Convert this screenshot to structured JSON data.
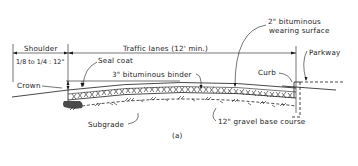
{
  "figure": {
    "label": "(a)",
    "type": "cross-section diagram of road pavement"
  },
  "dimensions": {
    "shoulder": {
      "label": "Shoulder",
      "slope": "1/8 to 1/4 : 12\""
    },
    "traffic_lanes": {
      "label": "Traffic lanes (12' min.)"
    }
  },
  "callouts": {
    "seal_coat": "Seal coat",
    "binder": "3\" bituminous binder",
    "wearing_surface_line1": "2\" bituminous",
    "wearing_surface_line2": "wearing surface",
    "crown": "Crown",
    "curb": "Curb",
    "parkway": "Parkway",
    "subgrade": "Subgrade",
    "base_course": "12\" gravel base course"
  },
  "shoulder_slope_display": "1/8 to 1/4 : 12\"",
  "shoulder_slope_parts": {
    "a": "1/8",
    "to": "to",
    "b": "1/4",
    "sep": ":",
    "c": "12\""
  }
}
